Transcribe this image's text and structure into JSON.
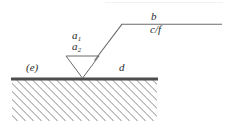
{
  "figure": {
    "name": "wedge-on-hatched-ground-diagram",
    "width": 230,
    "height": 129,
    "background": "#ffffff",
    "stroke_color": "#555555",
    "ground_color": "#4d4d4d",
    "hatch_color": "#8c8c8c",
    "labels": {
      "b": "b",
      "cf": "c/f",
      "a1_base": "a",
      "a1_sub": "1",
      "a2_base": "a",
      "a2_sub": "2",
      "e": "(e)",
      "d": "d"
    },
    "geometry": {
      "ground_line": {
        "x1": 12,
        "y1": 79,
        "x2": 157,
        "y2": 79,
        "width": 2.6
      },
      "hatch_region": {
        "x": 12,
        "y": 80,
        "width": 145,
        "height": 41,
        "angle_deg": 45,
        "spacing": 4
      },
      "triangle": {
        "left_x": 66,
        "right_x": 99,
        "top_y": 56,
        "apex_x": 82,
        "apex_y": 78
      },
      "diagonal": {
        "x1": 95,
        "y1": 60,
        "x2": 122,
        "y2": 24
      },
      "top_line": {
        "x1": 122,
        "y1": 24,
        "x2": 222,
        "y2": 24
      }
    }
  }
}
